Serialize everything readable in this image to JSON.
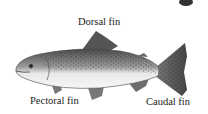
{
  "diagram": {
    "labels": {
      "dorsal": "Dorsal fin",
      "pectoral": "Pectoral fin",
      "caudal": "Caudal fin"
    }
  },
  "colors": {
    "body_dark": "#555555",
    "belly": "#f2f2f2",
    "fin": "#6a6a6a",
    "text": "#222222"
  }
}
